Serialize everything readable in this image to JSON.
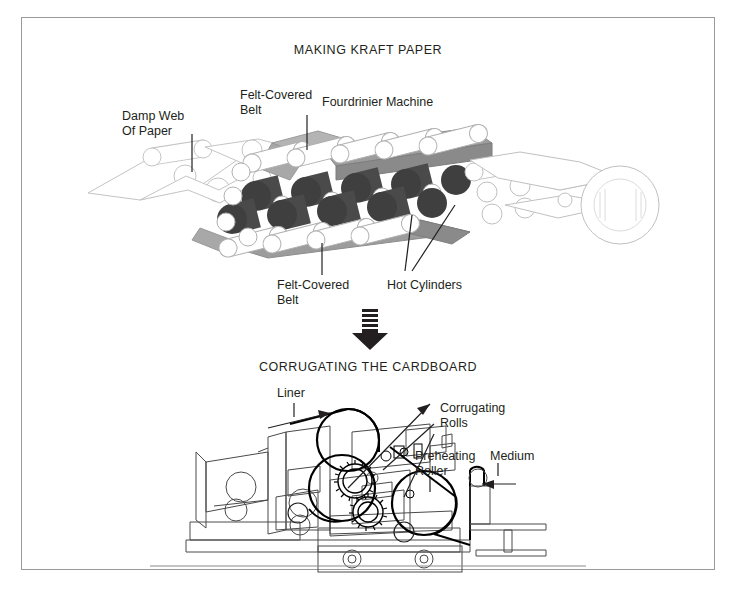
{
  "page": {
    "background": "#ffffff",
    "frame_border_color": "#9a9a9a",
    "ink_color": "#231f20"
  },
  "palette": {
    "hot_cylinder_dark": "#3f3f3f",
    "hot_cylinder_mid": "#4f4f4f",
    "belt_gray": "#9a9a9a",
    "belt_gray_light": "#b9b9b9",
    "roller_white": "#ffffff",
    "outline_light": "#b0b0b0",
    "outline_dark": "#231f20"
  },
  "sections": {
    "top": {
      "title": "MAKING KRAFT PAPER",
      "labels": {
        "damp_web": "Damp Web\nOf Paper",
        "damp_web_line1": "Damp Web",
        "damp_web_line2": "Of Paper",
        "felt_top_line1": "Felt-Covered",
        "felt_top_line2": "Belt",
        "fourdrinier": "Fourdrinier Machine",
        "felt_bottom_line1": "Felt-Covered",
        "felt_bottom_line2": "Belt",
        "hot_cylinders": "Hot Cylinders"
      }
    },
    "connector": {
      "icon": "down-arrow-icon",
      "stripes": 5
    },
    "bottom": {
      "title": "CORRUGATING THE CARDBOARD",
      "labels": {
        "liner": "Liner",
        "corrugating_line1": "Corrugating",
        "corrugating_line2": "Rolls",
        "preheating_line1": "Preheating",
        "preheating_line2": "Roller",
        "medium": "Medium"
      }
    }
  }
}
